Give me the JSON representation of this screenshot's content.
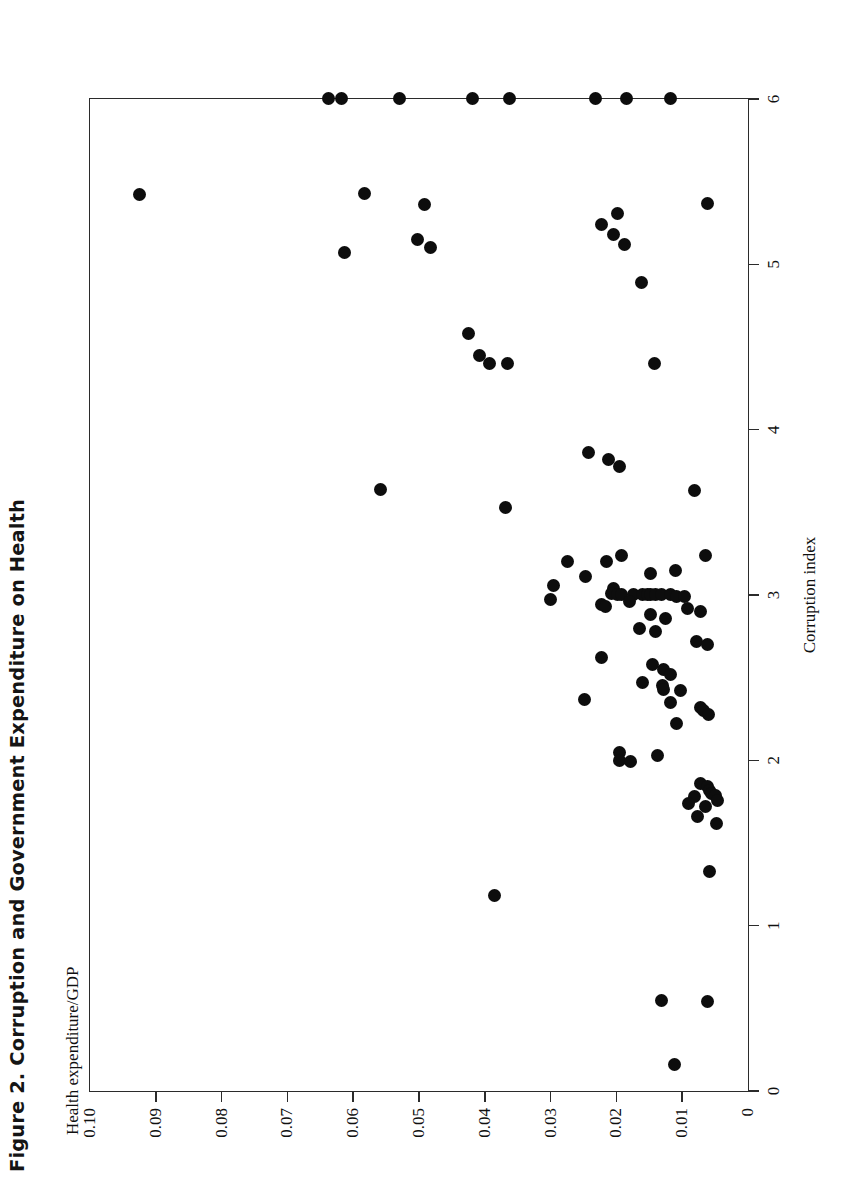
{
  "figure": {
    "title": "Figure 2. Corruption and Government Expenditure on Health",
    "ylabel_note": "Health expenditure/GDP"
  },
  "chart_data": {
    "type": "scatter",
    "title": "Figure 2. Corruption and Government Expenditure on Health",
    "xlabel": "Corruption index",
    "ylabel": "Health expenditure/GDP",
    "xlim": [
      0,
      6
    ],
    "ylim": [
      0,
      0.1
    ],
    "xticks": [
      0,
      1,
      2,
      3,
      4,
      5,
      6
    ],
    "xticklabels": [
      "0",
      "1",
      "2",
      "3",
      "4",
      "5",
      "6"
    ],
    "yticks": [
      0,
      0.01,
      0.02,
      0.03,
      0.04,
      0.05,
      0.06,
      0.07,
      0.08,
      0.09,
      0.1
    ],
    "yticklabels": [
      "0",
      "0.01",
      "0.02",
      "0.03",
      "0.04",
      "0.05",
      "0.06",
      "0.07",
      "0.08",
      "0.09",
      "0.10"
    ],
    "grid": false,
    "legend": null,
    "marker": "filled-circle",
    "marker_color": "#0d0d0d",
    "n_points": 97,
    "points": [
      [
        5.42,
        0.0925
      ],
      [
        5.07,
        0.0613
      ],
      [
        5.43,
        0.0583
      ],
      [
        5.36,
        0.0492
      ],
      [
        5.15,
        0.0503
      ],
      [
        5.1,
        0.0483
      ],
      [
        5.31,
        0.0198
      ],
      [
        5.37,
        0.0062
      ],
      [
        5.24,
        0.0222
      ],
      [
        5.18,
        0.0205
      ],
      [
        5.12,
        0.0188
      ],
      [
        4.89,
        0.0162
      ],
      [
        4.58,
        0.0425
      ],
      [
        4.45,
        0.0408
      ],
      [
        4.4,
        0.0393
      ],
      [
        4.4,
        0.0365
      ],
      [
        4.4,
        0.0142
      ],
      [
        3.64,
        0.0558
      ],
      [
        3.63,
        0.0082
      ],
      [
        3.53,
        0.0368
      ],
      [
        3.82,
        0.0212
      ],
      [
        3.78,
        0.0195
      ],
      [
        3.86,
        0.0242
      ],
      [
        3.2,
        0.0275
      ],
      [
        3.11,
        0.0247
      ],
      [
        3.06,
        0.0295
      ],
      [
        3.2,
        0.0215
      ],
      [
        3.24,
        0.0192
      ],
      [
        3.13,
        0.0148
      ],
      [
        3.24,
        0.0065
      ],
      [
        3.15,
        0.011
      ],
      [
        3.04,
        0.0205
      ],
      [
        3.01,
        0.0208
      ],
      [
        3.0,
        0.0198
      ],
      [
        3.0,
        0.0192
      ],
      [
        3.0,
        0.0174
      ],
      [
        3.0,
        0.016
      ],
      [
        3.0,
        0.0152
      ],
      [
        3.0,
        0.0148
      ],
      [
        3.0,
        0.014
      ],
      [
        3.0,
        0.0132
      ],
      [
        3.0,
        0.0118
      ],
      [
        2.99,
        0.0108
      ],
      [
        2.99,
        0.0096
      ],
      [
        2.97,
        0.03
      ],
      [
        2.96,
        0.018
      ],
      [
        2.94,
        0.0222
      ],
      [
        2.93,
        0.0216
      ],
      [
        2.92,
        0.0092
      ],
      [
        2.9,
        0.0072
      ],
      [
        2.88,
        0.0148
      ],
      [
        2.86,
        0.0125
      ],
      [
        2.8,
        0.0165
      ],
      [
        2.78,
        0.014
      ],
      [
        2.72,
        0.0078
      ],
      [
        2.7,
        0.0062
      ],
      [
        2.62,
        0.0222
      ],
      [
        2.58,
        0.0145
      ],
      [
        2.55,
        0.0128
      ],
      [
        2.52,
        0.0118
      ],
      [
        2.47,
        0.016
      ],
      [
        2.45,
        0.013
      ],
      [
        2.43,
        0.0128
      ],
      [
        2.42,
        0.0102
      ],
      [
        2.37,
        0.0248
      ],
      [
        2.35,
        0.0118
      ],
      [
        2.32,
        0.0072
      ],
      [
        2.3,
        0.0068
      ],
      [
        2.28,
        0.006
      ],
      [
        2.22,
        0.0108
      ],
      [
        2.05,
        0.0195
      ],
      [
        2.03,
        0.0138
      ],
      [
        2.0,
        0.0196
      ],
      [
        1.99,
        0.0178
      ],
      [
        1.86,
        0.0072
      ],
      [
        1.84,
        0.0062
      ],
      [
        1.82,
        0.0058
      ],
      [
        1.8,
        0.0056
      ],
      [
        1.79,
        0.005
      ],
      [
        1.78,
        0.0082
      ],
      [
        1.76,
        0.0046
      ],
      [
        1.74,
        0.009
      ],
      [
        1.72,
        0.0065
      ],
      [
        1.66,
        0.0076
      ],
      [
        1.62,
        0.0048
      ],
      [
        1.33,
        0.0058
      ],
      [
        1.18,
        0.0385
      ],
      [
        0.55,
        0.0132
      ],
      [
        0.54,
        0.0062
      ],
      [
        0.16,
        0.0112
      ],
      [
        6.0,
        0.0638
      ],
      [
        6.0,
        0.0618
      ],
      [
        6.0,
        0.053
      ],
      [
        6.0,
        0.0418
      ],
      [
        6.0,
        0.0362
      ],
      [
        6.0,
        0.0232
      ],
      [
        6.0,
        0.0185
      ],
      [
        6.0,
        0.0118
      ]
    ]
  }
}
